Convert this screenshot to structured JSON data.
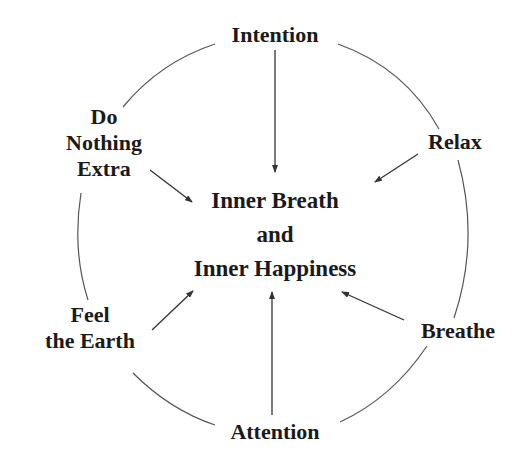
{
  "diagram": {
    "center": {
      "lines": [
        "Inner Breath",
        "and",
        "Inner Happiness"
      ]
    },
    "nodes": {
      "top": {
        "label": "Intention"
      },
      "upper_left": {
        "lines": [
          "Do",
          "Nothing",
          "Extra"
        ]
      },
      "upper_right": {
        "label": "Relax"
      },
      "lower_left": {
        "lines": [
          "Feel",
          "the Earth"
        ]
      },
      "lower_right": {
        "label": "Breathe"
      },
      "bottom": {
        "label": "Attention"
      }
    },
    "edges": [
      {
        "from": "Intention",
        "to": "Inner Breath and Inner Happiness"
      },
      {
        "from": "Do Nothing Extra",
        "to": "Inner Breath and Inner Happiness"
      },
      {
        "from": "Relax",
        "to": "Inner Breath and Inner Happiness"
      },
      {
        "from": "Feel the Earth",
        "to": "Inner Breath and Inner Happiness"
      },
      {
        "from": "Breathe",
        "to": "Inner Breath and Inner Happiness"
      },
      {
        "from": "Attention",
        "to": "Inner Breath and Inner Happiness"
      }
    ],
    "colors": {
      "text": "#1a1a1a",
      "line": "#444444",
      "background": "#ffffff"
    }
  }
}
